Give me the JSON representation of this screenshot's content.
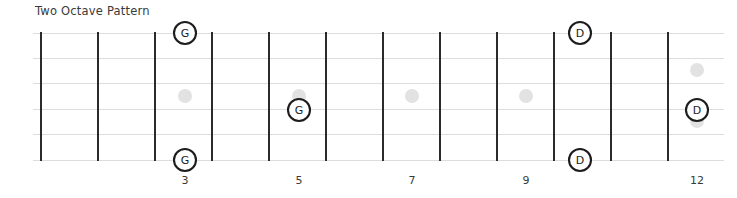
{
  "title": "Two Octave Pattern",
  "colors": {
    "background": "#ffffff",
    "fret_line": "#2b2b2b",
    "string_line": "#dddddd",
    "inlay_dot": "#e2e2e2",
    "note_fill": "#ffffff",
    "note_stroke": "#1d1d1d",
    "text": "#3a3a3a"
  },
  "fretboard": {
    "string_count": 6,
    "fret_count": 13,
    "first_fret_x": 41,
    "fret_spacing": 57,
    "top_string_y": 33,
    "string_spacing": 25.4,
    "board_left": 33,
    "board_right": 724
  },
  "fret_numbers": [
    {
      "label": "3",
      "fret": 3,
      "x": 185,
      "y": 184
    },
    {
      "label": "5",
      "fret": 5,
      "x": 299,
      "y": 184
    },
    {
      "label": "7",
      "fret": 7,
      "x": 412,
      "y": 184
    },
    {
      "label": "9",
      "fret": 9,
      "x": 526,
      "y": 184
    },
    {
      "label": "12",
      "fret": 12,
      "x": 697,
      "y": 184
    }
  ],
  "inlay_dots": [
    {
      "fret": 3,
      "x": 185,
      "y": 96,
      "r": 7
    },
    {
      "fret": 5,
      "x": 299,
      "y": 96,
      "r": 7
    },
    {
      "fret": 7,
      "x": 412,
      "y": 96,
      "r": 7
    },
    {
      "fret": 9,
      "x": 526,
      "y": 96,
      "r": 7
    },
    {
      "fret": 12,
      "x": 697,
      "y": 70,
      "r": 7
    },
    {
      "fret": 12,
      "x": 697,
      "y": 121,
      "r": 7
    }
  ],
  "notes": [
    {
      "label": "G",
      "fret": 3,
      "string": 1,
      "x": 185,
      "y": 33,
      "r": 11
    },
    {
      "label": "G",
      "fret": 5,
      "string": 4,
      "x": 299,
      "y": 110,
      "r": 11
    },
    {
      "label": "G",
      "fret": 3,
      "string": 6,
      "x": 185,
      "y": 160,
      "r": 11
    },
    {
      "label": "D",
      "fret": 10,
      "string": 1,
      "x": 580,
      "y": 33,
      "r": 11
    },
    {
      "label": "D",
      "fret": 12,
      "string": 4,
      "x": 697,
      "y": 110,
      "r": 11
    },
    {
      "label": "D",
      "fret": 10,
      "string": 6,
      "x": 580,
      "y": 160,
      "r": 11
    }
  ]
}
